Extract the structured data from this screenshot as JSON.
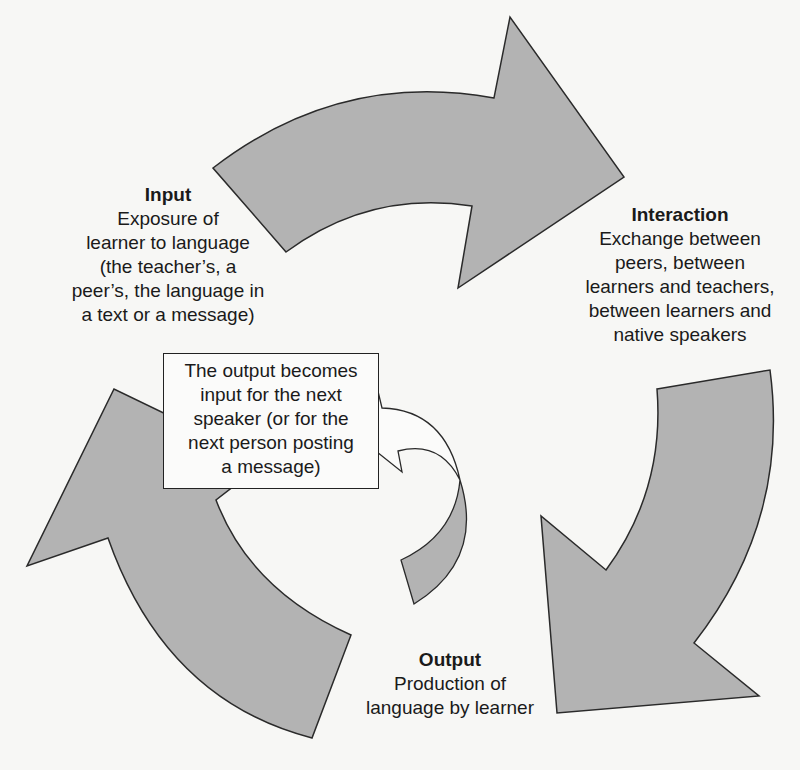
{
  "diagram": {
    "type": "cycle",
    "arrow_fill": "#b3b3b3",
    "arrow_stroke": "#2a2a2a",
    "background": "#f7f7f5",
    "nodes": [
      {
        "id": "input",
        "title": "Input",
        "lines": [
          "Exposure of",
          "learner to language",
          "(the teacher’s, a",
          "peer’s, the language in",
          "a text or a message)"
        ]
      },
      {
        "id": "interaction",
        "title": "Interaction",
        "lines": [
          "Exchange between",
          "peers, between",
          "learners and teachers,",
          "between learners and",
          "native speakers"
        ]
      },
      {
        "id": "output",
        "title": "Output",
        "lines": [
          "Production of",
          "language by learner"
        ]
      }
    ],
    "edges": [
      {
        "from": "input",
        "to": "interaction"
      },
      {
        "from": "interaction",
        "to": "output"
      },
      {
        "from": "output",
        "to": "input"
      },
      {
        "from": "output",
        "to": "note",
        "style": "small-curved"
      }
    ],
    "note": {
      "lines": [
        "The output becomes",
        "input for the next",
        "speaker (or for the",
        "next person posting",
        "a message)"
      ]
    }
  }
}
